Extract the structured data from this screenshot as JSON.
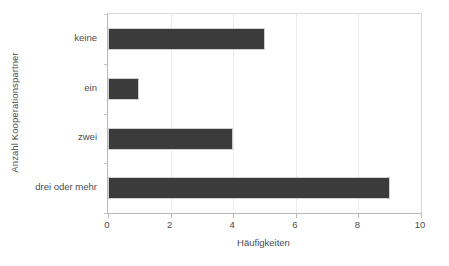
{
  "chart_data": {
    "type": "bar",
    "orientation": "horizontal",
    "title": "",
    "xlabel": "Häufigkeiten",
    "ylabel": "Anzahl Kooperationspartner",
    "categories": [
      "keine",
      "ein",
      "zwei",
      "drei oder mehr"
    ],
    "values": [
      5,
      1,
      4,
      9
    ],
    "series": [
      {
        "name": "Häufigkeiten",
        "values": [
          5,
          1,
          4,
          9
        ]
      }
    ],
    "xlim": [
      0,
      10
    ],
    "xticks": [
      0,
      2,
      4,
      6,
      8,
      10
    ],
    "xtick_labels": [
      "0",
      "2",
      "4",
      "6",
      "8",
      "10"
    ],
    "grid": true,
    "grid_axis": "x",
    "legend": false,
    "legend_position": "none",
    "bar_color": "#3b3b3b",
    "bar_edge_color": "#cfcfcf",
    "axis_color": "#b9b9b9",
    "grid_color": "#ececec",
    "text_color": "#4a4a4a",
    "background": "#ffffff"
  }
}
